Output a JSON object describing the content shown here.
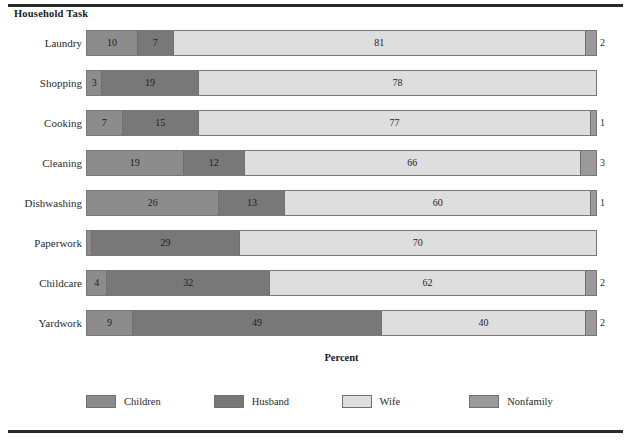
{
  "figure": {
    "y_axis_title": "Household Task",
    "x_axis_title": "Percent"
  },
  "legend": {
    "items": [
      {
        "label": "Children",
        "color": "#8c8c8c"
      },
      {
        "label": "Husband",
        "color": "#787878"
      },
      {
        "label": "Wife",
        "color": "#dedede"
      },
      {
        "label": "Nonfamily",
        "color": "#9a9a9a"
      }
    ]
  },
  "chart_data": {
    "type": "bar",
    "orientation": "horizontal",
    "stacked": true,
    "title": "",
    "xlabel": "Percent",
    "ylabel": "Household Task",
    "xlim": [
      0,
      100
    ],
    "grid": false,
    "legend_position": "bottom",
    "categories": [
      "Laundry",
      "Shopping",
      "Cooking",
      "Cleaning",
      "Dishwashing",
      "Paperwork",
      "Childcare",
      "Yardwork"
    ],
    "series": [
      {
        "name": "Children",
        "color": "#8c8c8c",
        "values": [
          10,
          3,
          7,
          19,
          26,
          1,
          4,
          9
        ]
      },
      {
        "name": "Husband",
        "color": "#787878",
        "values": [
          7,
          19,
          15,
          12,
          13,
          29,
          32,
          49
        ]
      },
      {
        "name": "Wife",
        "color": "#dedede",
        "values": [
          81,
          78,
          77,
          66,
          60,
          70,
          62,
          40
        ]
      },
      {
        "name": "Nonfamily",
        "color": "#9a9a9a",
        "values": [
          2,
          0,
          1,
          3,
          1,
          0,
          2,
          2
        ]
      }
    ],
    "rows": [
      {
        "category": "Laundry",
        "segments": [
          {
            "series": "Children",
            "value": 10,
            "label": "10",
            "label_outside": false
          },
          {
            "series": "Husband",
            "value": 7,
            "label": "7",
            "label_outside": false
          },
          {
            "series": "Wife",
            "value": 81,
            "label": "81",
            "label_outside": false
          },
          {
            "series": "Nonfamily",
            "value": 2,
            "label": "2",
            "label_outside": true
          }
        ]
      },
      {
        "category": "Shopping",
        "segments": [
          {
            "series": "Children",
            "value": 3,
            "label": "3",
            "label_outside": false
          },
          {
            "series": "Husband",
            "value": 19,
            "label": "19",
            "label_outside": false
          },
          {
            "series": "Wife",
            "value": 78,
            "label": "78",
            "label_outside": false
          }
        ]
      },
      {
        "category": "Cooking",
        "segments": [
          {
            "series": "Children",
            "value": 7,
            "label": "7",
            "label_outside": false
          },
          {
            "series": "Husband",
            "value": 15,
            "label": "15",
            "label_outside": false
          },
          {
            "series": "Wife",
            "value": 77,
            "label": "77",
            "label_outside": false
          },
          {
            "series": "Nonfamily",
            "value": 1,
            "label": "1",
            "label_outside": true
          }
        ]
      },
      {
        "category": "Cleaning",
        "segments": [
          {
            "series": "Children",
            "value": 19,
            "label": "19",
            "label_outside": false
          },
          {
            "series": "Husband",
            "value": 12,
            "label": "12",
            "label_outside": false
          },
          {
            "series": "Wife",
            "value": 66,
            "label": "66",
            "label_outside": false
          },
          {
            "series": "Nonfamily",
            "value": 3,
            "label": "3",
            "label_outside": true
          }
        ]
      },
      {
        "category": "Dishwashing",
        "segments": [
          {
            "series": "Children",
            "value": 26,
            "label": "26",
            "label_outside": false
          },
          {
            "series": "Husband",
            "value": 13,
            "label": "13",
            "label_outside": false
          },
          {
            "series": "Wife",
            "value": 60,
            "label": "60",
            "label_outside": false
          },
          {
            "series": "Nonfamily",
            "value": 1,
            "label": "1",
            "label_outside": true
          }
        ]
      },
      {
        "category": "Paperwork",
        "segments": [
          {
            "series": "Children",
            "value": 1,
            "label": "1",
            "label_outside": false
          },
          {
            "series": "Husband",
            "value": 29,
            "label": "29",
            "label_outside": false
          },
          {
            "series": "Wife",
            "value": 70,
            "label": "70",
            "label_outside": false
          }
        ]
      },
      {
        "category": "Childcare",
        "segments": [
          {
            "series": "Children",
            "value": 4,
            "label": "4",
            "label_outside": false
          },
          {
            "series": "Husband",
            "value": 32,
            "label": "32",
            "label_outside": false
          },
          {
            "series": "Wife",
            "value": 62,
            "label": "62",
            "label_outside": false
          },
          {
            "series": "Nonfamily",
            "value": 2,
            "label": "2",
            "label_outside": true
          }
        ]
      },
      {
        "category": "Yardwork",
        "segments": [
          {
            "series": "Children",
            "value": 9,
            "label": "9",
            "label_outside": false
          },
          {
            "series": "Husband",
            "value": 49,
            "label": "49",
            "label_outside": false
          },
          {
            "series": "Wife",
            "value": 40,
            "label": "40",
            "label_outside": false
          },
          {
            "series": "Nonfamily",
            "value": 2,
            "label": "2",
            "label_outside": true
          }
        ]
      }
    ]
  }
}
